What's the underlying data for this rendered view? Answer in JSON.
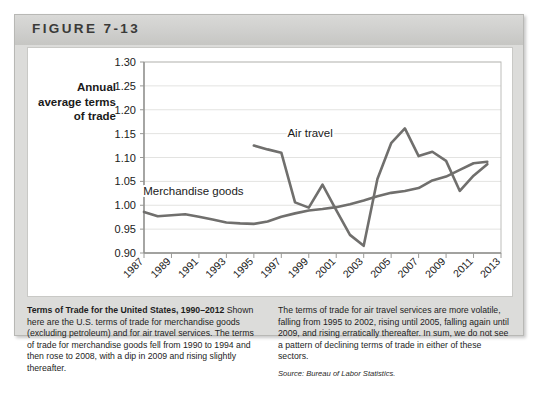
{
  "figure": {
    "label": "FIGURE 7-13"
  },
  "axis_title": "Annual average terms of trade",
  "captions": {
    "left_bold": "Terms of Trade for the United States, 1990–2012",
    "left_body": " Shown here are the U.S. terms of trade for merchandise goods (excluding petroleum) and for air travel services. The terms of trade for merchandise goods fell from 1990 to 1994 and then rose to 2008, with a dip in 2009 and rising slightly thereafter.",
    "right_body": "The terms of trade for air travel services are more volatile, falling from 1995 to 2002, rising until 2005, falling again until 2009, and rising erratically thereafter. In sum, we do not see a pattern of declining terms of trade in either of these sectors.",
    "source": "Source: Bureau of Labor Statistics."
  },
  "chart_data": {
    "type": "line",
    "title": "Terms of Trade for the United States, 1990–2012",
    "xlabel": "",
    "ylabel": "Annual average terms of trade",
    "xlim": [
      1987,
      2013
    ],
    "ylim": [
      0.9,
      1.3
    ],
    "ytick_step": 0.05,
    "ytick_labels": [
      "0.90",
      "0.95",
      "1.00",
      "1.05",
      "1.10",
      "1.15",
      "1.20",
      "1.25",
      "1.30"
    ],
    "xtick_labels": [
      "1987",
      "1989",
      "1991",
      "1993",
      "1995",
      "1997",
      "1999",
      "2001",
      "2003",
      "2005",
      "2007",
      "2009",
      "2011",
      "2013"
    ],
    "grid": true,
    "legend": "inline-labels",
    "line_color": "#706f6d",
    "series": [
      {
        "name": "Merchandise goods",
        "label_x": 1990.6,
        "label_y": 1.022,
        "x": [
          1987,
          1988,
          1989,
          1990,
          1991,
          1992,
          1993,
          1994,
          1995,
          1996,
          1997,
          1998,
          1999,
          2000,
          2001,
          2002,
          2003,
          2004,
          2005,
          2006,
          2007,
          2008,
          2009,
          2010,
          2011,
          2012
        ],
        "values": [
          0.986,
          0.977,
          0.979,
          0.981,
          0.976,
          0.97,
          0.964,
          0.962,
          0.961,
          0.966,
          0.976,
          0.983,
          0.989,
          0.992,
          0.996,
          1.002,
          1.01,
          1.019,
          1.026,
          1.03,
          1.036,
          1.052,
          1.06,
          1.074,
          1.088,
          1.091
        ]
      },
      {
        "name": "Air travel",
        "label_x": 1999.1,
        "label_y": 1.142,
        "x": [
          1995,
          1996,
          1997,
          1998,
          1999,
          2000,
          2001,
          2002,
          2003,
          2004,
          2005,
          2006,
          2007,
          2008,
          2009,
          2010,
          2011,
          2012
        ],
        "values": [
          1.125,
          1.117,
          1.11,
          1.006,
          0.995,
          1.043,
          0.99,
          0.938,
          0.915,
          1.055,
          1.13,
          1.161,
          1.103,
          1.112,
          1.093,
          1.03,
          1.062,
          1.086
        ]
      }
    ]
  }
}
